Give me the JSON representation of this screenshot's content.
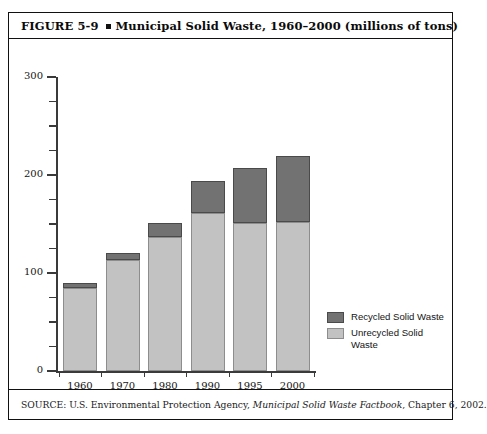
{
  "figure": {
    "label": "FIGURE  5-9",
    "bullet": "square-bullet",
    "title": "Municipal Solid Waste, 1960–2000 (millions of tons)",
    "source_prefix": "SOURCE: U.S. Environmental Protection Agency, ",
    "source_italic": "Municipal Solid Waste Factbook",
    "source_suffix": ", Chapter 6, 2002."
  },
  "legend": {
    "position": "inside-bottom-right",
    "items": [
      {
        "label": "Recycled Solid Waste",
        "color": "#727272"
      },
      {
        "label": "Unrecycled Solid Waste",
        "color": "#c2c2c2"
      }
    ]
  },
  "chart_data": {
    "type": "bar",
    "stacked": true,
    "title": "Municipal Solid Waste, 1960–2000 (millions of tons)",
    "xlabel": "",
    "ylabel": "",
    "categories": [
      "1960",
      "1970",
      "1980",
      "1990",
      "1995",
      "2000"
    ],
    "series": [
      {
        "name": "Unrecycled Solid Waste",
        "color": "#c2c2c2",
        "values": [
          85,
          113,
          137,
          161,
          151,
          152
        ]
      },
      {
        "name": "Recycled Solid Waste",
        "color": "#727272",
        "values": [
          5,
          7,
          14,
          33,
          56,
          67
        ]
      }
    ],
    "totals": [
      90,
      120,
      151,
      194,
      207,
      219
    ],
    "ylim": [
      0,
      300
    ],
    "ytick_labels": [
      "0",
      "100",
      "200",
      "300"
    ],
    "ytick_values": [
      0,
      100,
      200,
      300
    ],
    "yminor_step": 25,
    "grid": false,
    "units": "millions of tons"
  }
}
